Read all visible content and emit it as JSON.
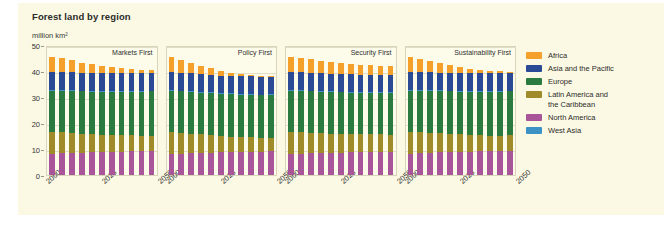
{
  "chart_data": {
    "type": "bar",
    "title": "Forest land by region",
    "subtitle": "million km²",
    "ylabel": "million km²",
    "xlabel": "",
    "stacked": true,
    "ylim": [
      0,
      50
    ],
    "yticks": [
      0,
      10,
      20,
      30,
      40,
      50
    ],
    "grid": true,
    "legend_position": "right",
    "x": [
      2000,
      2005,
      2010,
      2015,
      2020,
      2025,
      2030,
      2035,
      2040,
      2045,
      2050
    ],
    "xtick_labels": [
      "2000",
      "2025",
      "2050"
    ],
    "xtick_values": [
      2000,
      2025,
      2050
    ],
    "series_order_bottom_to_top": [
      "North America",
      "Latin America and the Caribbean",
      "Europe",
      "West Asia",
      "Asia and the Pacific",
      "Africa"
    ],
    "colors": {
      "Africa": "#f5a02a",
      "Asia and the Pacific": "#2b4a96",
      "Europe": "#2b7a40",
      "Latin America and the Caribbean": "#a08b2a",
      "North America": "#a8559a",
      "West Asia": "#3c92c4"
    },
    "panels": [
      {
        "name": "Markets First",
        "series": [
          {
            "name": "North America",
            "values": [
              8.0,
              8.3,
              8.5,
              8.6,
              8.7,
              8.8,
              8.9,
              9.0,
              9.1,
              9.2,
              9.3
            ]
          },
          {
            "name": "Latin America and the Caribbean",
            "values": [
              8.5,
              8.1,
              7.7,
              7.3,
              7.0,
              6.7,
              6.5,
              6.3,
              6.1,
              6.0,
              5.9
            ]
          },
          {
            "name": "Europe",
            "values": [
              16.0,
              16.1,
              16.2,
              16.3,
              16.4,
              16.5,
              16.6,
              16.7,
              16.8,
              16.9,
              17.0
            ]
          },
          {
            "name": "West Asia",
            "values": [
              0.2,
              0.2,
              0.2,
              0.2,
              0.2,
              0.2,
              0.2,
              0.2,
              0.2,
              0.2,
              0.2
            ]
          },
          {
            "name": "Asia and the Pacific",
            "values": [
              6.8,
              6.8,
              6.8,
              6.8,
              6.8,
              6.8,
              6.8,
              6.8,
              6.9,
              6.9,
              6.9
            ]
          },
          {
            "name": "Africa",
            "values": [
              6.0,
              5.3,
              4.6,
              4.0,
              3.4,
              2.9,
              2.4,
              2.0,
              1.6,
              1.3,
              1.0
            ]
          }
        ],
        "totals": [
          45.5,
          44.8,
          44.0,
          43.2,
          42.5,
          41.9,
          41.4,
          41.0,
          40.7,
          40.5,
          40.3
        ]
      },
      {
        "name": "Policy First",
        "series": [
          {
            "name": "North America",
            "values": [
              8.0,
              8.2,
              8.4,
              8.5,
              8.6,
              8.7,
              8.8,
              8.9,
              9.0,
              9.0,
              9.1
            ]
          },
          {
            "name": "Latin America and the Caribbean",
            "values": [
              8.5,
              8.0,
              7.5,
              7.1,
              6.7,
              6.3,
              6.0,
              5.7,
              5.5,
              5.3,
              5.2
            ]
          },
          {
            "name": "Europe",
            "values": [
              16.0,
              16.0,
              16.1,
              16.1,
              16.2,
              16.2,
              16.3,
              16.3,
              16.4,
              16.4,
              16.5
            ]
          },
          {
            "name": "West Asia",
            "values": [
              0.2,
              0.2,
              0.2,
              0.2,
              0.2,
              0.2,
              0.2,
              0.2,
              0.2,
              0.2,
              0.2
            ]
          },
          {
            "name": "Asia and the Pacific",
            "values": [
              6.8,
              6.8,
              6.8,
              6.8,
              6.8,
              6.8,
              6.8,
              6.8,
              6.8,
              6.8,
              6.8
            ]
          },
          {
            "name": "Africa",
            "values": [
              6.0,
              5.0,
              4.1,
              3.3,
              2.5,
              1.8,
              1.2,
              0.8,
              0.5,
              0.3,
              0.2
            ]
          }
        ],
        "totals": [
          45.5,
          44.2,
          43.1,
          42.0,
          41.0,
          40.0,
          39.3,
          38.7,
          38.4,
          38.0,
          38.0
        ]
      },
      {
        "name": "Security First",
        "series": [
          {
            "name": "North America",
            "values": [
              8.0,
              8.2,
              8.3,
              8.4,
              8.5,
              8.6,
              8.7,
              8.8,
              8.9,
              9.0,
              9.0
            ]
          },
          {
            "name": "Latin America and the Caribbean",
            "values": [
              8.5,
              8.2,
              7.9,
              7.6,
              7.4,
              7.2,
              7.0,
              6.8,
              6.7,
              6.6,
              6.5
            ]
          },
          {
            "name": "Europe",
            "values": [
              16.0,
              16.0,
              16.0,
              16.0,
              16.0,
              16.0,
              16.0,
              16.0,
              16.0,
              16.0,
              16.0
            ]
          },
          {
            "name": "West Asia",
            "values": [
              0.2,
              0.2,
              0.2,
              0.2,
              0.2,
              0.2,
              0.2,
              0.2,
              0.2,
              0.2,
              0.2
            ]
          },
          {
            "name": "Asia and the Pacific",
            "values": [
              6.8,
              6.8,
              6.8,
              6.8,
              6.8,
              6.8,
              6.8,
              6.8,
              6.8,
              6.8,
              6.8
            ]
          },
          {
            "name": "Africa",
            "values": [
              6.0,
              5.6,
              5.2,
              4.9,
              4.6,
              4.3,
              4.0,
              3.8,
              3.6,
              3.4,
              3.2
            ]
          }
        ],
        "totals": [
          45.5,
          45.0,
          44.4,
          43.9,
          43.5,
          43.1,
          42.7,
          42.4,
          42.2,
          42.0,
          41.7
        ]
      },
      {
        "name": "Sustainability First",
        "series": [
          {
            "name": "North America",
            "values": [
              8.0,
              8.3,
              8.5,
              8.7,
              8.8,
              8.9,
              9.0,
              9.1,
              9.2,
              9.3,
              9.4
            ]
          },
          {
            "name": "Latin America and the Caribbean",
            "values": [
              8.5,
              8.1,
              7.7,
              7.3,
              7.0,
              6.7,
              6.4,
              6.2,
              6.0,
              5.9,
              5.8
            ]
          },
          {
            "name": "Europe",
            "values": [
              16.0,
              16.1,
              16.2,
              16.3,
              16.4,
              16.5,
              16.6,
              16.7,
              16.8,
              16.9,
              17.0
            ]
          },
          {
            "name": "West Asia",
            "values": [
              0.2,
              0.2,
              0.2,
              0.2,
              0.2,
              0.2,
              0.2,
              0.2,
              0.2,
              0.2,
              0.2
            ]
          },
          {
            "name": "Asia and the Pacific",
            "values": [
              6.8,
              6.8,
              6.8,
              6.8,
              6.8,
              6.8,
              6.8,
              6.8,
              6.8,
              6.8,
              6.8
            ]
          },
          {
            "name": "Africa",
            "values": [
              6.0,
              5.2,
              4.4,
              3.7,
              3.0,
              2.4,
              1.9,
              1.4,
              1.0,
              0.7,
              0.5
            ]
          }
        ],
        "totals": [
          45.5,
          44.7,
          43.8,
          43.0,
          42.2,
          41.5,
          40.7,
          40.2,
          40.0,
          39.8,
          39.7
        ]
      }
    ],
    "legend": [
      {
        "label": "Africa",
        "color": "#f5a02a"
      },
      {
        "label": "Asia and the Pacific",
        "color": "#2b4a96"
      },
      {
        "label": "Europe",
        "color": "#2b7a40"
      },
      {
        "label": "Latin America and\nthe Caribbean",
        "color": "#a08b2a"
      },
      {
        "label": "North America",
        "color": "#a8559a"
      },
      {
        "label": "West Asia",
        "color": "#3c92c4"
      }
    ]
  },
  "style": {
    "background": "#fbf9e3",
    "panel_background": "#fdfbea",
    "grid_color": "#e2dfc6",
    "text_color": "#2b2b2b"
  }
}
